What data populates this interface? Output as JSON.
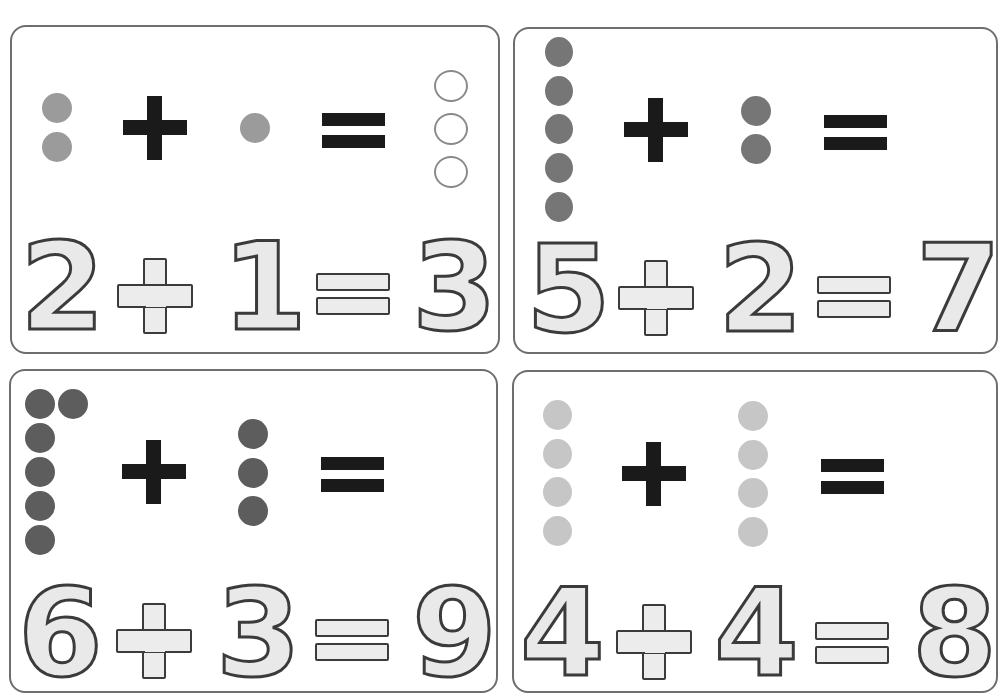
{
  "worksheet": {
    "type": "addition-tracing-cards",
    "colors": {
      "card_border": "#6e6e6e",
      "operator_dark": "#1a1a1a",
      "trace_fill": "#e9e9e9",
      "trace_outline": "#3b3b3b",
      "trace_guide": "#9a9a9a"
    },
    "cards": [
      {
        "id": "card-1",
        "equation": {
          "a": "2",
          "op": "+",
          "b": "1",
          "eq": "=",
          "result": "3"
        },
        "dots_a": 2,
        "dots_b": 1,
        "answer_circles": 3,
        "dot_color": "#9b9b9b"
      },
      {
        "id": "card-2",
        "equation": {
          "a": "5",
          "op": "+",
          "b": "2",
          "eq": "=",
          "result": "7"
        },
        "dots_a": 5,
        "dots_b": 2,
        "answer_circles": 0,
        "dot_color": "#767676"
      },
      {
        "id": "card-3",
        "equation": {
          "a": "6",
          "op": "+",
          "b": "3",
          "eq": "=",
          "result": "9"
        },
        "dots_a": 6,
        "dots_b": 3,
        "answer_circles": 0,
        "dot_color": "#5d5d5d"
      },
      {
        "id": "card-4",
        "equation": {
          "a": "4",
          "op": "+",
          "b": "4",
          "eq": "=",
          "result": "8"
        },
        "dots_a": 4,
        "dots_b": 4,
        "answer_circles": 0,
        "dot_color": "#c6c6c6"
      }
    ]
  }
}
